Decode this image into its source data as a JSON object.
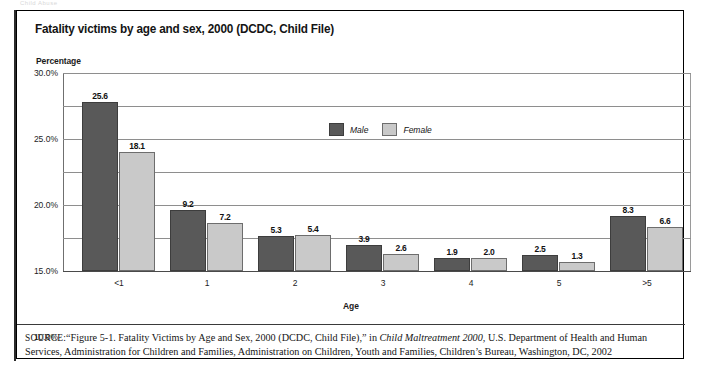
{
  "page": {
    "top_artifact": "Child Abuse"
  },
  "figure": {
    "title": "Fatality victims by age and sex, 2000 (DCDC, Child File)",
    "source_label": "SOURCE:",
    "source_text_1": "“Figure 5-1. Fatality Victims by Age and Sex, 2000 (DCDC, Child File),” in ",
    "source_italic": "Child Maltreatment 2000,",
    "source_text_2": " U.S. Department of Health and Human Services, Administration for Children and Families, Administration on Children, Youth and Families, Children’s Bureau, Washington, DC, 2002"
  },
  "chart_data": {
    "type": "bar",
    "title": "Fatality victims by age and sex, 2000 (DCDC, Child File)",
    "xlabel": "Age",
    "ylabel": "Percentage",
    "ylim": [
      0,
      30
    ],
    "ytick_labels": [
      "30.0%",
      "25.0%",
      "20.0%",
      "15.0%",
      "10.0%",
      "5.0%",
      "0.0%"
    ],
    "ytick_values": [
      30,
      25,
      20,
      15,
      10,
      5,
      0
    ],
    "grid": true,
    "legend_position": "upper-center",
    "categories": [
      "<1",
      "1",
      "2",
      "3",
      "4",
      "5",
      ">5"
    ],
    "series": [
      {
        "name": "Male",
        "color": "#595959",
        "values": [
          25.6,
          9.2,
          5.3,
          3.9,
          1.9,
          2.5,
          8.3
        ],
        "labels": [
          "25.6",
          "9.2",
          "5.3",
          "3.9",
          "1.9",
          "2.5",
          "8.3"
        ]
      },
      {
        "name": "Female",
        "color": "#c9c9c9",
        "values": [
          18.1,
          7.2,
          5.4,
          2.6,
          2.0,
          1.3,
          6.6
        ],
        "labels": [
          "18.1",
          "7.2",
          "5.4",
          "2.6",
          "2.0",
          "1.3",
          "6.6"
        ]
      }
    ]
  }
}
